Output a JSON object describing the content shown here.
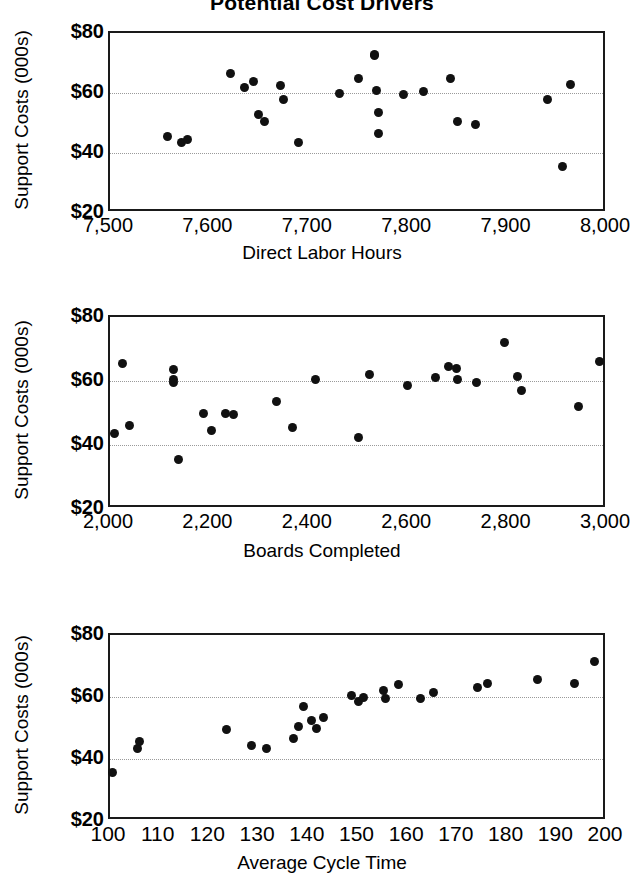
{
  "figure": {
    "title": "Potential Cost Drivers",
    "y_axis_label": "Support Costs (000s)",
    "y_ticks": [
      "$20",
      "$40",
      "$60",
      "$80"
    ],
    "marker_color": "#111111",
    "frame_color": "#1a1a1a",
    "gridline_color": "#9a9a9a"
  },
  "chart_data": [
    {
      "type": "scatter",
      "title": "Potential Cost Drivers",
      "xlabel": "Direct Labor Hours",
      "ylabel": "Support Costs (000s)",
      "xlim": [
        7500,
        8000
      ],
      "ylim": [
        20,
        80
      ],
      "xticks": [
        7500,
        7600,
        7700,
        7800,
        7900,
        8000
      ],
      "xtick_labels": [
        "7,500",
        "7,600",
        "7,700",
        "7,800",
        "7,900",
        "8,000"
      ],
      "yticks": [
        20,
        40,
        60,
        80
      ],
      "ytick_labels": [
        "$20",
        "$40",
        "$60",
        "$80"
      ],
      "grid": "horizontal dotted at 40 and 60",
      "points": [
        {
          "x": 7558,
          "y": 45.5
        },
        {
          "x": 7572,
          "y": 43.5
        },
        {
          "x": 7578,
          "y": 44.5
        },
        {
          "x": 7621,
          "y": 66.5
        },
        {
          "x": 7635,
          "y": 62.0
        },
        {
          "x": 7644,
          "y": 64.0
        },
        {
          "x": 7649,
          "y": 53.0
        },
        {
          "x": 7655,
          "y": 50.5
        },
        {
          "x": 7672,
          "y": 62.5
        },
        {
          "x": 7675,
          "y": 58.0
        },
        {
          "x": 7690,
          "y": 43.5
        },
        {
          "x": 7731,
          "y": 60.0
        },
        {
          "x": 7750,
          "y": 65.0
        },
        {
          "x": 7766,
          "y": 72.5
        },
        {
          "x": 7766,
          "y": 73.0
        },
        {
          "x": 7768,
          "y": 61.0
        },
        {
          "x": 7770,
          "y": 53.5
        },
        {
          "x": 7770,
          "y": 46.5
        },
        {
          "x": 7795,
          "y": 59.5
        },
        {
          "x": 7815,
          "y": 60.5
        },
        {
          "x": 7843,
          "y": 65.0
        },
        {
          "x": 7850,
          "y": 50.5
        },
        {
          "x": 7868,
          "y": 49.5
        },
        {
          "x": 7940,
          "y": 58.0
        },
        {
          "x": 7955,
          "y": 35.5
        },
        {
          "x": 7963,
          "y": 63.0
        }
      ]
    },
    {
      "type": "scatter",
      "xlabel": "Boards Completed",
      "ylabel": "Support Costs (000s)",
      "xlim": [
        2000,
        3000
      ],
      "ylim": [
        20,
        80
      ],
      "xticks": [
        2000,
        2200,
        2400,
        2600,
        2800,
        3000
      ],
      "xtick_labels": [
        "2,000",
        "2,200",
        "2,400",
        "2,600",
        "2,800",
        "3,000"
      ],
      "yticks": [
        20,
        40,
        60,
        80
      ],
      "ytick_labels": [
        "$20",
        "$40",
        "$60",
        "$80"
      ],
      "grid": "horizontal dotted at 40 and 60",
      "points": [
        {
          "x": 2010,
          "y": 43.5
        },
        {
          "x": 2025,
          "y": 65.5
        },
        {
          "x": 2040,
          "y": 46.0
        },
        {
          "x": 2127,
          "y": 63.5
        },
        {
          "x": 2128,
          "y": 60.5
        },
        {
          "x": 2128,
          "y": 59.5
        },
        {
          "x": 2138,
          "y": 35.5
        },
        {
          "x": 2188,
          "y": 50.0
        },
        {
          "x": 2205,
          "y": 44.5
        },
        {
          "x": 2233,
          "y": 50.0
        },
        {
          "x": 2248,
          "y": 49.5
        },
        {
          "x": 2335,
          "y": 53.5
        },
        {
          "x": 2368,
          "y": 45.5
        },
        {
          "x": 2413,
          "y": 60.5
        },
        {
          "x": 2500,
          "y": 42.5
        },
        {
          "x": 2522,
          "y": 62.0
        },
        {
          "x": 2598,
          "y": 58.5
        },
        {
          "x": 2655,
          "y": 61.0
        },
        {
          "x": 2682,
          "y": 64.5
        },
        {
          "x": 2697,
          "y": 64.0
        },
        {
          "x": 2700,
          "y": 60.5
        },
        {
          "x": 2738,
          "y": 59.5
        },
        {
          "x": 2793,
          "y": 72.0
        },
        {
          "x": 2820,
          "y": 61.5
        },
        {
          "x": 2828,
          "y": 57.0
        },
        {
          "x": 2943,
          "y": 52.0
        },
        {
          "x": 2985,
          "y": 66.0
        }
      ]
    },
    {
      "type": "scatter",
      "xlabel": "Average Cycle Time",
      "ylabel": "Support Costs (000s)",
      "xlim": [
        100,
        200
      ],
      "ylim": [
        20,
        80
      ],
      "xticks": [
        100,
        110,
        120,
        130,
        140,
        150,
        160,
        170,
        180,
        190,
        200
      ],
      "xtick_labels": [
        "100",
        "110",
        "120",
        "130",
        "140",
        "150",
        "160",
        "170",
        "180",
        "190",
        "200"
      ],
      "yticks": [
        20,
        40,
        60,
        80
      ],
      "ytick_labels": [
        "$20",
        "$40",
        "$60",
        "$80"
      ],
      "grid": "horizontal dotted at 40 and 60",
      "points": [
        {
          "x": 100.5,
          "y": 35.5
        },
        {
          "x": 105.5,
          "y": 43.5
        },
        {
          "x": 106.0,
          "y": 45.5
        },
        {
          "x": 123.5,
          "y": 49.5
        },
        {
          "x": 128.5,
          "y": 44.5
        },
        {
          "x": 131.5,
          "y": 43.5
        },
        {
          "x": 137.0,
          "y": 46.5
        },
        {
          "x": 138.0,
          "y": 50.5
        },
        {
          "x": 139.0,
          "y": 57.0
        },
        {
          "x": 140.5,
          "y": 52.5
        },
        {
          "x": 141.5,
          "y": 50.0
        },
        {
          "x": 143.0,
          "y": 53.5
        },
        {
          "x": 148.5,
          "y": 60.5
        },
        {
          "x": 150.0,
          "y": 58.5
        },
        {
          "x": 151.0,
          "y": 60.0
        },
        {
          "x": 155.0,
          "y": 62.0
        },
        {
          "x": 155.5,
          "y": 59.5
        },
        {
          "x": 158.0,
          "y": 64.0
        },
        {
          "x": 162.5,
          "y": 59.5
        },
        {
          "x": 165.0,
          "y": 61.5
        },
        {
          "x": 174.0,
          "y": 63.0
        },
        {
          "x": 176.0,
          "y": 64.5
        },
        {
          "x": 186.0,
          "y": 65.5
        },
        {
          "x": 193.5,
          "y": 64.5
        },
        {
          "x": 197.5,
          "y": 71.5
        }
      ]
    }
  ]
}
